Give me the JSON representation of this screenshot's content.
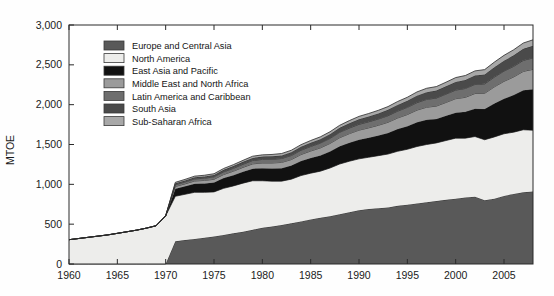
{
  "chart_data": {
    "type": "area",
    "stacked": true,
    "title": "",
    "xlabel": "",
    "ylabel": "MTOE",
    "xlim": [
      1960,
      2008
    ],
    "ylim": [
      0,
      3000
    ],
    "grid": false,
    "legend_position": "upper-left-inside",
    "y_ticks": [
      0,
      500,
      1000,
      1500,
      2000,
      2500,
      3000
    ],
    "y_tick_labels": [
      "0",
      "500",
      "1,000",
      "1,500",
      "2,000",
      "2,500",
      "3,000"
    ],
    "x_ticks": [
      1960,
      1965,
      1970,
      1975,
      1980,
      1985,
      1990,
      1995,
      2000,
      2005
    ],
    "x_tick_labels": [
      "1960",
      "1965",
      "1970",
      "1975",
      "1980",
      "1985",
      "1990",
      "1995",
      "2000",
      "2005"
    ],
    "x": [
      1960,
      1961,
      1962,
      1963,
      1964,
      1965,
      1966,
      1967,
      1968,
      1969,
      1970,
      1971,
      1972,
      1973,
      1974,
      1975,
      1976,
      1977,
      1978,
      1979,
      1980,
      1981,
      1982,
      1983,
      1984,
      1985,
      1986,
      1987,
      1988,
      1989,
      1990,
      1991,
      1992,
      1993,
      1994,
      1995,
      1996,
      1997,
      1998,
      1999,
      2000,
      2001,
      2002,
      2003,
      2004,
      2005,
      2006,
      2007,
      2008
    ],
    "series": [
      {
        "name": "Europe and Central Asia",
        "color": "#595959",
        "values": [
          0,
          0,
          0,
          0,
          0,
          0,
          0,
          0,
          0,
          0,
          0,
          285,
          300,
          315,
          330,
          345,
          365,
          385,
          405,
          430,
          455,
          470,
          490,
          510,
          535,
          560,
          580,
          600,
          625,
          650,
          675,
          690,
          700,
          710,
          730,
          745,
          760,
          775,
          790,
          805,
          820,
          835,
          845,
          800,
          820,
          855,
          880,
          900,
          910
        ]
      },
      {
        "name": "North America",
        "color": "#ededeb",
        "values": [
          305,
          320,
          335,
          350,
          365,
          385,
          405,
          425,
          450,
          480,
          605,
          565,
          575,
          585,
          570,
          560,
          585,
          595,
          610,
          615,
          590,
          570,
          550,
          555,
          575,
          580,
          585,
          605,
          630,
          640,
          645,
          650,
          660,
          670,
          685,
          695,
          715,
          725,
          730,
          745,
          760,
          745,
          755,
          760,
          775,
          780,
          775,
          785,
          770
        ]
      },
      {
        "name": "East Asia and Pacific",
        "color": "#111111",
        "values": [
          0,
          0,
          0,
          0,
          0,
          0,
          0,
          0,
          0,
          0,
          0,
          95,
          100,
          108,
          112,
          118,
          128,
          135,
          143,
          152,
          158,
          160,
          163,
          170,
          182,
          190,
          198,
          208,
          222,
          232,
          240,
          245,
          252,
          265,
          278,
          290,
          305,
          310,
          300,
          310,
          320,
          330,
          350,
          385,
          420,
          440,
          465,
          495,
          515
        ]
      },
      {
        "name": "Middle East and North Africa",
        "color": "#9b9b9b",
        "values": [
          0,
          0,
          0,
          0,
          0,
          0,
          0,
          0,
          0,
          0,
          0,
          28,
          31,
          34,
          37,
          40,
          45,
          50,
          55,
          60,
          65,
          68,
          72,
          76,
          82,
          88,
          94,
          100,
          108,
          114,
          120,
          124,
          129,
          134,
          140,
          146,
          152,
          158,
          162,
          168,
          175,
          182,
          190,
          198,
          208,
          218,
          228,
          238,
          248
        ]
      },
      {
        "name": "Latin America and Caribbean",
        "color": "#6e6e6e",
        "values": [
          0,
          0,
          0,
          0,
          0,
          0,
          0,
          0,
          0,
          0,
          0,
          22,
          24,
          26,
          28,
          30,
          33,
          36,
          39,
          42,
          45,
          47,
          49,
          51,
          54,
          57,
          60,
          63,
          67,
          70,
          73,
          76,
          79,
          82,
          86,
          90,
          94,
          98,
          101,
          104,
          108,
          111,
          114,
          118,
          123,
          128,
          133,
          138,
          143
        ]
      },
      {
        "name": "South Asia",
        "color": "#4a4a4a",
        "values": [
          0,
          0,
          0,
          0,
          0,
          0,
          0,
          0,
          0,
          0,
          0,
          18,
          19,
          21,
          22,
          24,
          26,
          28,
          30,
          33,
          35,
          37,
          39,
          41,
          44,
          47,
          50,
          53,
          57,
          60,
          64,
          67,
          70,
          74,
          78,
          82,
          87,
          91,
          94,
          98,
          103,
          107,
          112,
          118,
          124,
          131,
          138,
          145,
          152
        ]
      },
      {
        "name": "Sub-Saharan Africa",
        "color": "#a8a8a8",
        "values": [
          0,
          0,
          0,
          0,
          0,
          0,
          0,
          0,
          0,
          0,
          0,
          12,
          13,
          14,
          15,
          16,
          17,
          18,
          19,
          21,
          22,
          23,
          24,
          25,
          26,
          28,
          29,
          31,
          32,
          34,
          36,
          37,
          39,
          41,
          43,
          45,
          47,
          49,
          50,
          52,
          54,
          56,
          58,
          61,
          64,
          67,
          70,
          73,
          76
        ]
      }
    ]
  },
  "legend": {
    "items": [
      {
        "label": "Europe and Central Asia"
      },
      {
        "label": "North America"
      },
      {
        "label": "East Asia and Pacific"
      },
      {
        "label": "Middle East and North Africa"
      },
      {
        "label": "Latin America and Caribbean"
      },
      {
        "label": "South Asia"
      },
      {
        "label": "Sub-Saharan Africa"
      }
    ]
  }
}
